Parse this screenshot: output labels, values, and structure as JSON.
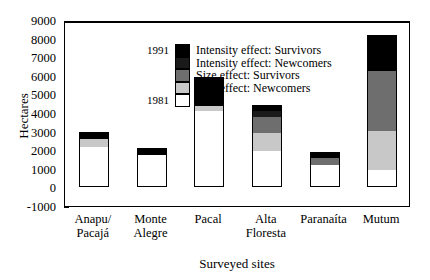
{
  "chart_data": {
    "type": "bar",
    "title": "",
    "subtitle": "",
    "xlabel": "Surveyed sites",
    "ylabel": "Hectares",
    "ylim": [
      -1000,
      9000
    ],
    "ytick_values": [
      9000,
      8000,
      7000,
      6000,
      5000,
      4000,
      3000,
      2000,
      1000,
      0,
      -1000
    ],
    "ytick_labels": [
      "9000",
      "8000",
      "7000",
      "6000",
      "5000",
      "4000",
      "3000",
      "2000",
      "1000",
      "0",
      "-1000"
    ],
    "grid": false,
    "stacked": true,
    "legend_position": "top-left-inside",
    "legend_side_labels": {
      "top": "1991",
      "bottom": "1981"
    },
    "categories": [
      "Anapu/\nPacajá",
      "Monte\nAlegre",
      "Pacal",
      "Alta\nFloresta",
      "Paranaíta",
      "Mutum"
    ],
    "series": [
      {
        "name": "1981",
        "legend_label": "1981",
        "color": "#ffffff",
        "values": [
          2200,
          1800,
          4150,
          1950,
          1200,
          900
        ]
      },
      {
        "name": "Size effect: Newcomers",
        "legend_label": "Size effect: Newcomers",
        "color": "#c8c8c8",
        "values": [
          450,
          0,
          250,
          1000,
          0,
          2100
        ]
      },
      {
        "name": "Size effect: Survivors",
        "legend_label": "Size effect: Survivors",
        "color": "#6e6e6e",
        "values": [
          0,
          0,
          0,
          900,
          400,
          3300
        ]
      },
      {
        "name": "Intensity effect: Newcomers",
        "legend_label": "Intensity effect: Newcomers",
        "color": "#1a1a1a",
        "values": [
          0,
          0,
          0,
          300,
          0,
          0
        ]
      },
      {
        "name": "Intensity effect: Survivors",
        "legend_label": "Intensity effect: Survivors",
        "color": "#000000",
        "values": [
          350,
          300,
          1550,
          300,
          300,
          1900
        ]
      }
    ],
    "totals": [
      3000,
      2100,
      5950,
      4450,
      1900,
      8200
    ]
  }
}
